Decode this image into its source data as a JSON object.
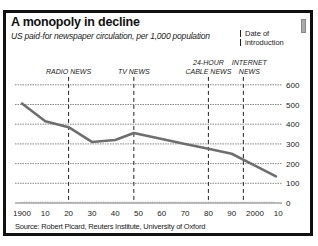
{
  "title": "A monopoly in decline",
  "subtitle": "US paid-for newspaper circulation, per 1,000 population",
  "legend": {
    "line1": "Date of",
    "line2": "introduction"
  },
  "source": "Source: Robert Picard, Reuters Institute, University of Oxford",
  "colors": {
    "line": "#6e6e6e",
    "grid": "#555555",
    "frame": "#111111",
    "text": "#222222"
  },
  "chart_data": {
    "type": "line",
    "title": "A monopoly in decline",
    "subtitle": "US paid-for newspaper circulation, per 1,000 population",
    "xlabel": "",
    "ylabel": "",
    "x": [
      1900,
      1910,
      1920,
      1930,
      1940,
      1948,
      1960,
      1970,
      1980,
      1990,
      2000,
      2009
    ],
    "series": [
      {
        "name": "Paid-for newspaper circulation per 1,000 population",
        "values": [
          505,
          415,
          385,
          310,
          320,
          355,
          325,
          300,
          275,
          250,
          190,
          135
        ]
      }
    ],
    "x_tick_labels": [
      "1900",
      "10",
      "20",
      "30",
      "40",
      "50",
      "60",
      "70",
      "80",
      "90",
      "2000",
      "10"
    ],
    "y_ticks": [
      0,
      100,
      200,
      300,
      400,
      500,
      600
    ],
    "ylim": [
      0,
      600
    ],
    "xlim": [
      1900,
      2010
    ],
    "y_axis_position": "right",
    "grid": "horizontal dotted",
    "annotations": [
      {
        "label": "RADIO NEWS",
        "year": 1920
      },
      {
        "label": "TV NEWS",
        "year": 1948
      },
      {
        "label": "24-HOUR CABLE NEWS",
        "year": 1980
      },
      {
        "label": "INTERNET NEWS",
        "year": 1995
      }
    ],
    "legend": "Date of introduction (vertical dashed lines)"
  }
}
